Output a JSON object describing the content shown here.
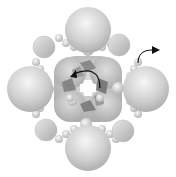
{
  "figure": {
    "title": "",
    "colors": {
      "background": "#ffffff",
      "large_sphere": "#c8c8c8",
      "large_sphere_highlight": "#f4f4f4",
      "small_sphere": "#d4d4d4",
      "center_polyhedra": "#7a7a7a",
      "arrow": "#111111"
    },
    "large_spheres": [
      {
        "id": "north",
        "cx": 88,
        "cy": 30,
        "r": 23
      },
      {
        "id": "south",
        "cx": 88,
        "cy": 148,
        "r": 23
      },
      {
        "id": "west",
        "cx": 30,
        "cy": 89,
        "r": 23
      },
      {
        "id": "east",
        "cx": 146,
        "cy": 89,
        "r": 23
      }
    ],
    "medium_spheres": [
      {
        "id": "nw",
        "cx": 44,
        "cy": 47,
        "r": 11
      },
      {
        "id": "ne",
        "cx": 119,
        "cy": 45,
        "r": 11
      },
      {
        "id": "sw",
        "cx": 46,
        "cy": 130,
        "r": 11
      },
      {
        "id": "se",
        "cx": 123,
        "cy": 131,
        "r": 11
      }
    ],
    "annotations": {
      "external_arrow": "curved arrow pointing right (top-right)",
      "center_arrow": "curved rotation arrow over central cluster"
    }
  }
}
